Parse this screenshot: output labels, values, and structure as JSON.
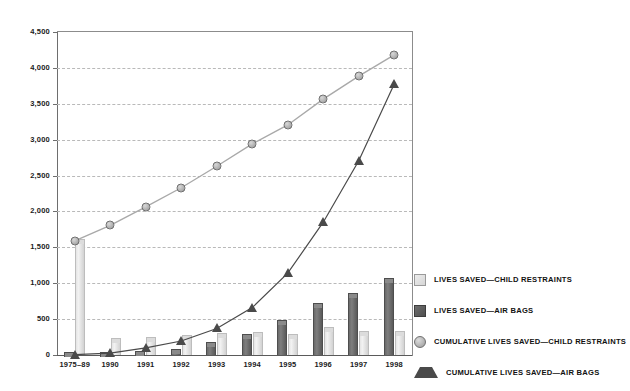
{
  "chart_data": {
    "type": "bar",
    "title": "",
    "subtitle": "",
    "xlabel": "",
    "ylabel": "",
    "ylim": [
      0,
      4500
    ],
    "ytick_values": [
      0,
      500,
      1000,
      1500,
      2000,
      2500,
      3000,
      3500,
      4000,
      4500
    ],
    "ytick_labels": [
      "0",
      "500",
      "1,000",
      "1,500",
      "2,000",
      "2,500",
      "3,000",
      "3,500",
      "4,000",
      "4,500"
    ],
    "grid": true,
    "grid_axis": "y",
    "legend_position": "right",
    "categories": [
      "1975–89",
      "1990",
      "1991",
      "1992",
      "1993",
      "1994",
      "1995",
      "1996",
      "1997",
      "1998"
    ],
    "series": [
      {
        "name": "LIVES SAVED—CHILD RESTRAINTS",
        "kind": "bar",
        "color": "#e0e0e0",
        "values": [
          1590,
          215,
          230,
          255,
          285,
          290,
          270,
          365,
          305,
          300
        ]
      },
      {
        "name": "LIVES SAVED—AIR BAGS",
        "kind": "bar",
        "color": "#5f5f5f",
        "values": [
          5,
          20,
          35,
          55,
          160,
          260,
          460,
          690,
          840,
          1050
        ]
      },
      {
        "name": "CUMULATIVE LIVES SAVED—CHILD RESTRAINTS",
        "kind": "line",
        "marker": "circle",
        "color": "#a9a9a9",
        "values": [
          1590,
          1805,
          2065,
          2330,
          2630,
          2940,
          3205,
          3565,
          3885,
          4180
        ]
      },
      {
        "name": "CUMULATIVE LIVES SAVED—AIR BAGS",
        "kind": "line",
        "marker": "triangle",
        "color": "#4a4a4a",
        "values": [
          5,
          25,
          100,
          195,
          370,
          660,
          1140,
          1850,
          2705,
          3775
        ]
      }
    ]
  },
  "legend": {
    "items": [
      {
        "label": "LIVES SAVED—CHILD RESTRAINTS",
        "swatch": "square-light",
        "icon_name": "legend-swatch-child-restraints"
      },
      {
        "label": "LIVES SAVED—AIR BAGS",
        "swatch": "square-dark",
        "icon_name": "legend-swatch-air-bags"
      },
      {
        "label": "CUMULATIVE LIVES SAVED—CHILD RESTRAINTS",
        "swatch": "circle-light",
        "icon_name": "legend-marker-cumulative-child-restraints"
      },
      {
        "label": "CUMULATIVE LIVES SAVED—AIR BAGS",
        "swatch": "triangle-dark",
        "icon_name": "legend-marker-cumulative-air-bags"
      }
    ]
  },
  "colors": {
    "background": "#ffffff",
    "axis": "#5a5a5a",
    "grid": "#b9b9b9",
    "bar_child_restraints": "#e0e0e0",
    "bar_air_bags": "#5f5f5f",
    "line_child_restraints": "#a9a9a9",
    "line_air_bags": "#4a4a4a",
    "text": "#111111"
  }
}
